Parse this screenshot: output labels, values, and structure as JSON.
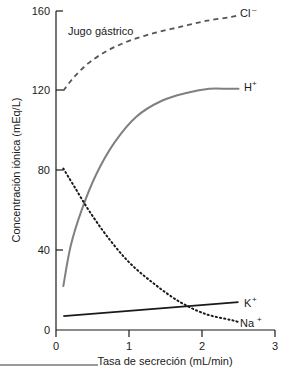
{
  "chart_data": {
    "type": "line",
    "title": "",
    "annotation": "Jugo gástrico",
    "xlabel": "Tasa de secreción (mL/min)",
    "ylabel": "Concentración iónica (mEq/L)",
    "xlim": [
      0,
      3
    ],
    "ylim": [
      0,
      160
    ],
    "xticks": [
      "0",
      "1",
      "2",
      "3"
    ],
    "xtick_values": [
      0,
      1,
      2,
      3
    ],
    "yticks": [
      "0",
      "40",
      "80",
      "120",
      "160"
    ],
    "ytick_values": [
      0,
      40,
      80,
      120,
      160
    ],
    "grid": false,
    "legend": "inline-right-end-labels",
    "series": [
      {
        "name": "Cl⁻",
        "label_base": "Cl",
        "label_sup": "–",
        "style": "dashed",
        "color": "#555555",
        "x": [
          0.1,
          0.25,
          0.45,
          0.7,
          1.0,
          1.35,
          1.7,
          2.05,
          2.4,
          2.5
        ],
        "y": [
          120,
          127,
          134,
          140,
          145,
          149,
          152,
          155,
          157,
          158
        ]
      },
      {
        "name": "H⁺",
        "label_base": "H",
        "label_sup": "+",
        "style": "solid",
        "color": "#808080",
        "x": [
          0.1,
          0.2,
          0.35,
          0.55,
          0.8,
          1.1,
          1.45,
          1.8,
          2.1,
          2.35,
          2.5
        ],
        "y": [
          22,
          42,
          60,
          78,
          94,
          107,
          115,
          119,
          121,
          121,
          121
        ]
      },
      {
        "name": "K⁺",
        "label_base": "K",
        "label_sup": "+",
        "style": "solid",
        "color": "#1a1a1a",
        "x": [
          0.1,
          2.5
        ],
        "y": [
          7,
          14
        ]
      },
      {
        "name": "Na⁺",
        "label_base": "Na",
        "label_sup": "+",
        "style": "dotted",
        "color": "#1a1a1a",
        "x": [
          0.1,
          0.25,
          0.45,
          0.7,
          1.0,
          1.35,
          1.7,
          2.05,
          2.4,
          2.5
        ],
        "y": [
          81,
          72,
          60,
          47,
          34,
          23,
          14,
          8,
          5,
          4
        ]
      }
    ]
  },
  "axes": {
    "y_title": "Concentración iónica (mEq/L)",
    "x_title": "Tasa de secreción (mL/min)"
  },
  "labels": {
    "annotation": "Jugo gástrico",
    "cl": {
      "base": "Cl",
      "sup": "–"
    },
    "h": {
      "base": "H",
      "sup": "+"
    },
    "k": {
      "base": "K",
      "sup": "+"
    },
    "na": {
      "base": "Na",
      "sup": "+"
    }
  },
  "ticks": {
    "y": [
      "160",
      "120",
      "80",
      "40",
      "0"
    ],
    "x": [
      "0",
      "1",
      "2",
      "3"
    ]
  }
}
